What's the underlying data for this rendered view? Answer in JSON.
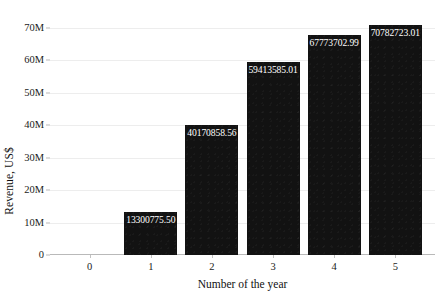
{
  "chart_data": {
    "type": "bar",
    "title": "",
    "xlabel": "Number of the year",
    "ylabel": "Revenue, US$",
    "categories": [
      "0",
      "1",
      "2",
      "3",
      "4",
      "5"
    ],
    "values": [
      null,
      13300775.5,
      40170858.56,
      59413585.01,
      67773702.99,
      70782723.01
    ],
    "bars": [
      {
        "category": "1",
        "value": 13300775.5,
        "label": "13300775.50"
      },
      {
        "category": "2",
        "value": 40170858.56,
        "label": "40170858.56"
      },
      {
        "category": "3",
        "value": 59413585.01,
        "label": "59413585.01"
      },
      {
        "category": "4",
        "value": 67773702.99,
        "label": "67773702.99"
      },
      {
        "category": "5",
        "value": 70782723.01,
        "label": "70782723.01"
      }
    ],
    "xticks": [
      "0",
      "1",
      "2",
      "3",
      "4",
      "5"
    ],
    "yticks": [
      "0",
      "10M",
      "20M",
      "30M",
      "40M",
      "50M",
      "60M",
      "70M"
    ],
    "ytick_values": [
      0,
      10000000,
      20000000,
      30000000,
      40000000,
      50000000,
      60000000,
      70000000
    ],
    "ylim": [
      0,
      73000000
    ],
    "xlim": [
      -0.65,
      5.65
    ],
    "grid": true,
    "grid_axis": "y",
    "legend": null,
    "bar_color": "#121212",
    "value_label_color": "#ffffff",
    "grid_color": "#ededed",
    "axis_color": "#b9b9b9"
  }
}
